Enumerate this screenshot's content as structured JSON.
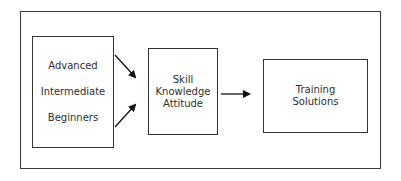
{
  "diagram": {
    "levels_box": {
      "items": [
        "Advanced",
        "Intermediate",
        "Beginners"
      ]
    },
    "competency_box": {
      "items": [
        "Skill",
        "Knowledge",
        "Attitude"
      ]
    },
    "output_box": {
      "items": [
        "Training",
        "Solutions"
      ]
    },
    "connections": [
      {
        "from": "levels_box",
        "to": "competency_box"
      },
      {
        "from": "levels_box",
        "to": "competency_box"
      },
      {
        "from": "competency_box",
        "to": "output_box"
      }
    ]
  }
}
